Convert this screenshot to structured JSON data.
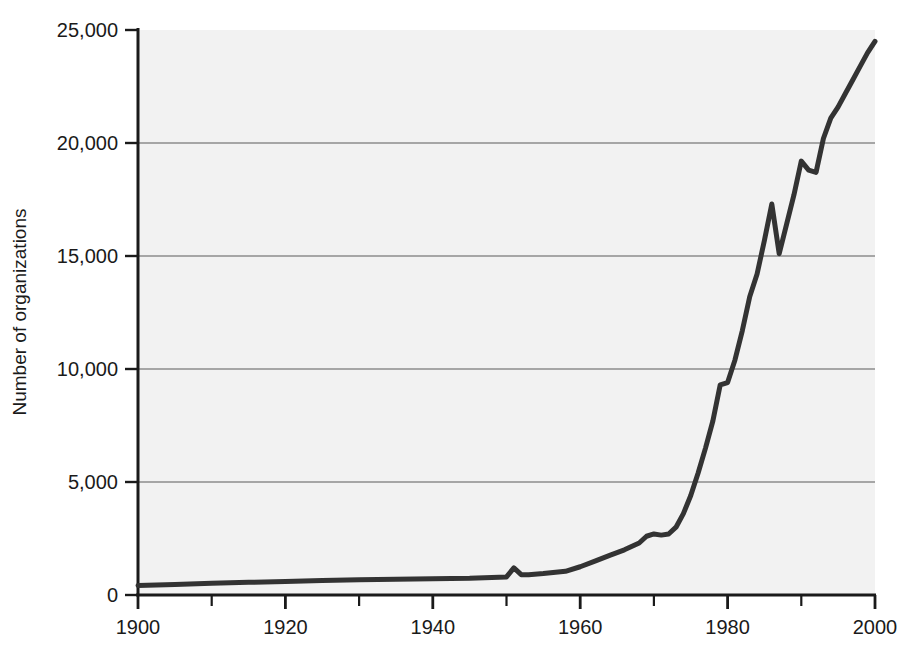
{
  "figure": {
    "background_color": "#ffffff",
    "plot_background_color": "#f2f2f2",
    "line_color": "#333333",
    "axis_color": "#1a1a1a",
    "gridline_color": "#8c8c8c"
  },
  "chart_data": {
    "type": "line",
    "title": "",
    "subtitle": "",
    "xlabel": "",
    "ylabel": "Number of organizations",
    "xlim": [
      1900,
      2000
    ],
    "ylim": [
      0,
      25000
    ],
    "xticks": [
      1900,
      1920,
      1940,
      1960,
      1980,
      2000
    ],
    "xtick_labels": [
      "1900",
      "1920",
      "1940",
      "1960",
      "1980",
      "2000"
    ],
    "x_minor_tick_interval": 10,
    "yticks": [
      0,
      5000,
      10000,
      15000,
      20000,
      25000
    ],
    "ytick_labels": [
      "0",
      "5,000",
      "10,000",
      "15,000",
      "20,000",
      "25,000"
    ],
    "grid": "horizontal",
    "gridline_values": [
      5000,
      10000,
      15000,
      20000
    ],
    "legend": "none",
    "legend_position": "none",
    "annotations": [],
    "series": [
      {
        "name": "International organizations",
        "x": [
          1900,
          1905,
          1910,
          1915,
          1920,
          1925,
          1930,
          1935,
          1940,
          1945,
          1950,
          1951,
          1952,
          1953,
          1955,
          1958,
          1960,
          1962,
          1964,
          1966,
          1968,
          1969,
          1970,
          1971,
          1972,
          1973,
          1974,
          1975,
          1976,
          1977,
          1978,
          1979,
          1980,
          1981,
          1982,
          1983,
          1984,
          1985,
          1986,
          1987,
          1988,
          1989,
          1990,
          1991,
          1992,
          1993,
          1994,
          1995,
          1996,
          1997,
          1998,
          1999,
          2000
        ],
        "y": [
          420,
          470,
          520,
          560,
          600,
          640,
          680,
          700,
          720,
          740,
          800,
          1200,
          900,
          900,
          950,
          1050,
          1250,
          1500,
          1750,
          2000,
          2300,
          2600,
          2700,
          2650,
          2700,
          3000,
          3600,
          4400,
          5400,
          6500,
          7700,
          9300,
          9400,
          10400,
          11700,
          13200,
          14200,
          15700,
          17300,
          15100,
          16400,
          17700,
          19200,
          18800,
          18700,
          20200,
          21100,
          21600,
          22200,
          22800,
          23400,
          24000,
          24500
        ]
      }
    ]
  },
  "showthrough_text": {
    "line1": "",
    "line2": ""
  },
  "caption": {
    "text": ""
  }
}
